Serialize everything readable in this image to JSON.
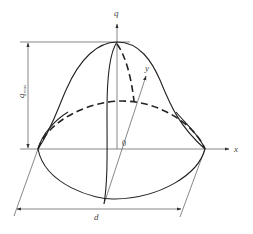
{
  "diagram": {
    "labels": {
      "q_axis": "q",
      "x_axis": "x",
      "y_axis": "y",
      "origin": "0",
      "q_max_main": "q",
      "q_max_sub": "max",
      "diameter": "d"
    },
    "colors": {
      "stroke": "#222222",
      "background": "#ffffff",
      "text": "#444444"
    }
  }
}
